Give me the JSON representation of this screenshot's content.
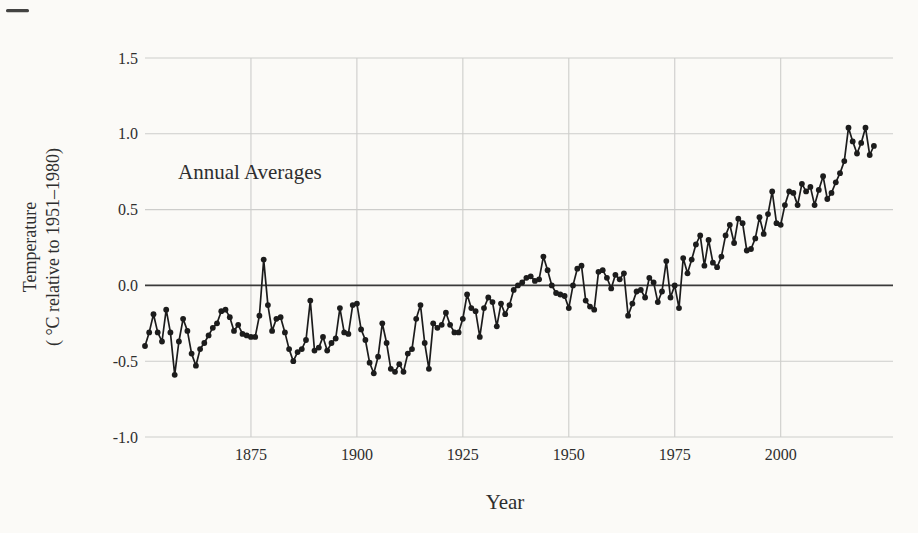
{
  "figure": {
    "title": "Annual Averages",
    "xlabel": "Year",
    "ylabel_line1": "Temperature",
    "ylabel_line2": "( °C relative to 1951–1980)"
  },
  "chart_data": {
    "type": "line",
    "marker": "filled-circle",
    "title": "Annual Averages",
    "xlabel": "Year",
    "ylabel": "Temperature ( °C relative to 1951–1980)",
    "series_name": "Global annual mean temperature anomaly",
    "x_start": 1850,
    "x_end": 2022,
    "x_step": 1,
    "values": [
      -0.4,
      -0.31,
      -0.19,
      -0.31,
      -0.37,
      -0.16,
      -0.31,
      -0.59,
      -0.37,
      -0.22,
      -0.3,
      -0.45,
      -0.53,
      -0.42,
      -0.38,
      -0.33,
      -0.28,
      -0.25,
      -0.17,
      -0.16,
      -0.21,
      -0.3,
      -0.26,
      -0.32,
      -0.33,
      -0.34,
      -0.34,
      -0.2,
      0.17,
      -0.13,
      -0.3,
      -0.22,
      -0.21,
      -0.31,
      -0.42,
      -0.5,
      -0.44,
      -0.42,
      -0.36,
      -0.1,
      -0.43,
      -0.41,
      -0.34,
      -0.43,
      -0.38,
      -0.35,
      -0.15,
      -0.31,
      -0.32,
      -0.13,
      -0.12,
      -0.29,
      -0.36,
      -0.51,
      -0.58,
      -0.47,
      -0.25,
      -0.38,
      -0.55,
      -0.57,
      -0.52,
      -0.57,
      -0.45,
      -0.42,
      -0.22,
      -0.13,
      -0.38,
      -0.55,
      -0.25,
      -0.28,
      -0.26,
      -0.18,
      -0.26,
      -0.31,
      -0.31,
      -0.22,
      -0.06,
      -0.15,
      -0.17,
      -0.34,
      -0.15,
      -0.08,
      -0.11,
      -0.27,
      -0.12,
      -0.19,
      -0.13,
      -0.03,
      0.0,
      0.02,
      0.05,
      0.06,
      0.03,
      0.04,
      0.19,
      0.1,
      0.0,
      -0.05,
      -0.06,
      -0.07,
      -0.15,
      0.0,
      0.11,
      0.13,
      -0.1,
      -0.14,
      -0.16,
      0.09,
      0.1,
      0.05,
      -0.02,
      0.07,
      0.04,
      0.08,
      -0.2,
      -0.12,
      -0.04,
      -0.03,
      -0.08,
      0.05,
      0.02,
      -0.11,
      -0.04,
      0.16,
      -0.08,
      0.0,
      -0.15,
      0.18,
      0.08,
      0.17,
      0.27,
      0.33,
      0.13,
      0.3,
      0.15,
      0.12,
      0.19,
      0.33,
      0.4,
      0.28,
      0.44,
      0.41,
      0.23,
      0.24,
      0.31,
      0.45,
      0.34,
      0.47,
      0.62,
      0.41,
      0.4,
      0.53,
      0.62,
      0.61,
      0.53,
      0.67,
      0.62,
      0.65,
      0.53,
      0.63,
      0.72,
      0.57,
      0.61,
      0.68,
      0.74,
      0.82,
      1.04,
      0.95,
      0.87,
      0.94,
      1.04,
      0.86,
      0.92
    ],
    "xlim": [
      1850,
      2026.5
    ],
    "ylim": [
      -1.0,
      1.5
    ],
    "xticks": [
      1875,
      1900,
      1925,
      1950,
      1975,
      2000
    ],
    "ytick_labels": [
      "1.5",
      "1.0",
      "0.5",
      "0.0",
      "-0.5",
      "-1.0"
    ],
    "ytick_values": [
      1.5,
      1.0,
      0.5,
      0.0,
      -0.5,
      -1.0
    ],
    "grid": true,
    "zero_line": true,
    "legend": "none",
    "colors": {
      "series": "#1c1c1c",
      "grid": "#cdcdcb",
      "zero_line": "#3a3a3a",
      "text": "#2e2e2e",
      "background": "#fbfaf7"
    }
  }
}
